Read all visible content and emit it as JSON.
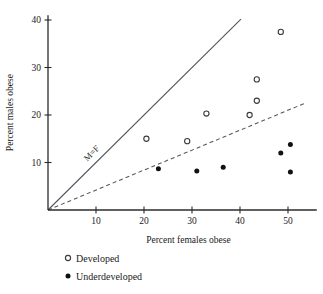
{
  "chart_data": {
    "type": "scatter",
    "title": "",
    "xlabel": "Percent females obese",
    "ylabel": "Percent males obese",
    "xlim": [
      0,
      56
    ],
    "ylim": [
      0,
      41
    ],
    "xticks": [
      10,
      20,
      30,
      40,
      50
    ],
    "yticks": [
      10,
      20,
      30,
      40
    ],
    "grid": false,
    "legend_position": "below-left",
    "annotations": [
      {
        "text": "M=F",
        "x": 9.5,
        "y": 11.5,
        "rotation": -45
      }
    ],
    "reference_lines": [
      {
        "name": "M=F",
        "style": "solid",
        "slope": 1.0,
        "intercept": 0,
        "x_start": 0,
        "x_end": 40.2
      },
      {
        "name": "trend",
        "style": "dashed",
        "slope": 0.42,
        "intercept": 0,
        "x_start": 0,
        "x_end": 53.5
      }
    ],
    "series": [
      {
        "name": "Developed",
        "marker": "open-circle",
        "points": [
          {
            "x": 20.5,
            "y": 15.0
          },
          {
            "x": 29.0,
            "y": 14.5
          },
          {
            "x": 33.0,
            "y": 20.3
          },
          {
            "x": 42.0,
            "y": 20.0
          },
          {
            "x": 43.5,
            "y": 23.0
          },
          {
            "x": 43.5,
            "y": 27.5
          },
          {
            "x": 48.5,
            "y": 37.5
          }
        ]
      },
      {
        "name": "Underdeveloped",
        "marker": "filled-circle",
        "points": [
          {
            "x": 23.0,
            "y": 8.7
          },
          {
            "x": 31.0,
            "y": 8.2
          },
          {
            "x": 36.5,
            "y": 9.0
          },
          {
            "x": 48.5,
            "y": 12.0
          },
          {
            "x": 50.5,
            "y": 13.8
          },
          {
            "x": 50.5,
            "y": 8.0
          }
        ]
      }
    ]
  },
  "legend": {
    "entries": [
      {
        "label": "Developed",
        "marker": "open-circle"
      },
      {
        "label": "Underdeveloped",
        "marker": "filled-circle"
      }
    ]
  },
  "colors": {
    "axis": "#2b2b2b",
    "reference_line": "#55555e",
    "open_marker": "#3a3a42",
    "filled_marker": "#111111",
    "background": "#ffffff"
  }
}
